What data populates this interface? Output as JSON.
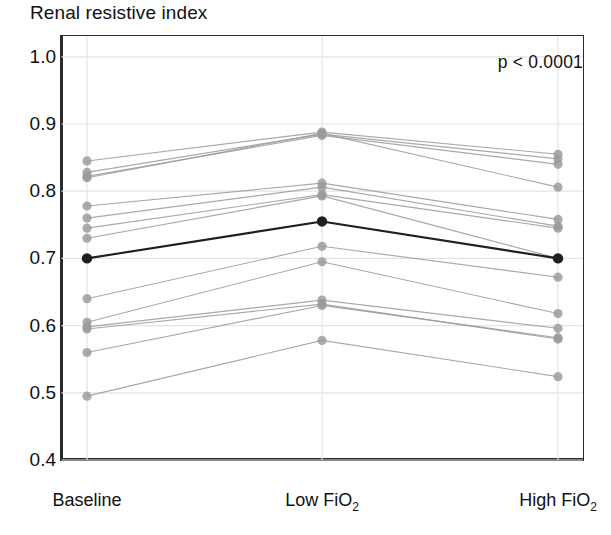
{
  "chart_data": {
    "type": "line",
    "title": "Renal resistive index",
    "xlabel": "",
    "ylabel": "",
    "ylim": [
      0.4,
      1.0
    ],
    "ytick_labels": [
      "1.0",
      "0.9",
      "0.8",
      "0.7",
      "0.6",
      "0.5",
      "0.4"
    ],
    "ytick_values": [
      1.0,
      0.9,
      0.8,
      0.7,
      0.6,
      0.5,
      0.4
    ],
    "categories": [
      "Baseline",
      "Low FiO2",
      "High FiO2"
    ],
    "category_labels_html": [
      "Baseline",
      "Low FiO<sub>2</sub>",
      "High FiO<sub>2</sub>"
    ],
    "grid": true,
    "legend": "none",
    "annotations": [
      {
        "text": "p < 0.0001",
        "position": "top-right"
      }
    ],
    "series": [
      {
        "name": "subject-1",
        "values": [
          0.845,
          0.888,
          0.855
        ],
        "highlight": false
      },
      {
        "name": "subject-2",
        "values": [
          0.828,
          0.885,
          0.848
        ],
        "highlight": false
      },
      {
        "name": "subject-3",
        "values": [
          0.822,
          0.883,
          0.84
        ],
        "highlight": false
      },
      {
        "name": "subject-4",
        "values": [
          0.82,
          0.886,
          0.806
        ],
        "highlight": false
      },
      {
        "name": "subject-5",
        "values": [
          0.778,
          0.812,
          0.758
        ],
        "highlight": false
      },
      {
        "name": "subject-6",
        "values": [
          0.76,
          0.806,
          0.748
        ],
        "highlight": false
      },
      {
        "name": "subject-7",
        "values": [
          0.745,
          0.795,
          0.745
        ],
        "highlight": false
      },
      {
        "name": "subject-8",
        "values": [
          0.73,
          0.793,
          0.7
        ],
        "highlight": false
      },
      {
        "name": "subject-9",
        "values": [
          0.7,
          0.755,
          0.7
        ],
        "highlight": true
      },
      {
        "name": "subject-10",
        "values": [
          0.64,
          0.718,
          0.672
        ],
        "highlight": false
      },
      {
        "name": "subject-11",
        "values": [
          0.605,
          0.695,
          0.618
        ],
        "highlight": false
      },
      {
        "name": "subject-12",
        "values": [
          0.598,
          0.638,
          0.596
        ],
        "highlight": false
      },
      {
        "name": "subject-13",
        "values": [
          0.595,
          0.632,
          0.58
        ],
        "highlight": false
      },
      {
        "name": "subject-14",
        "values": [
          0.56,
          0.63,
          0.582
        ],
        "highlight": false
      },
      {
        "name": "subject-15",
        "values": [
          0.495,
          0.578,
          0.524
        ],
        "highlight": false
      }
    ]
  },
  "style": {
    "line_color": "#9a9a9a",
    "marker_color": "#9a9a9a",
    "highlight_color": "#1f1f1f",
    "grid_color": "#e4e4e4",
    "axis_color": "#2b2b2b",
    "text_color": "#111111"
  }
}
